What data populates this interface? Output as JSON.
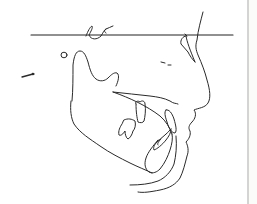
{
  "figure": {
    "type": "cephalometric-tracing",
    "stroke_color": "#2a2a2a",
    "background": "#ffffff",
    "border_color": "#d4d4d0"
  },
  "elements": [
    {
      "name": "frankfort-horizontal-line"
    },
    {
      "name": "sella-turcica"
    },
    {
      "name": "porion-marker"
    },
    {
      "name": "orbit-mark"
    },
    {
      "name": "nasal-bone"
    },
    {
      "name": "soft-tissue-profile"
    },
    {
      "name": "mandible-outline"
    },
    {
      "name": "palatal-plane"
    },
    {
      "name": "upper-molar"
    },
    {
      "name": "lower-molar"
    },
    {
      "name": "upper-incisor"
    },
    {
      "name": "lower-incisor"
    },
    {
      "name": "symphysis"
    }
  ]
}
